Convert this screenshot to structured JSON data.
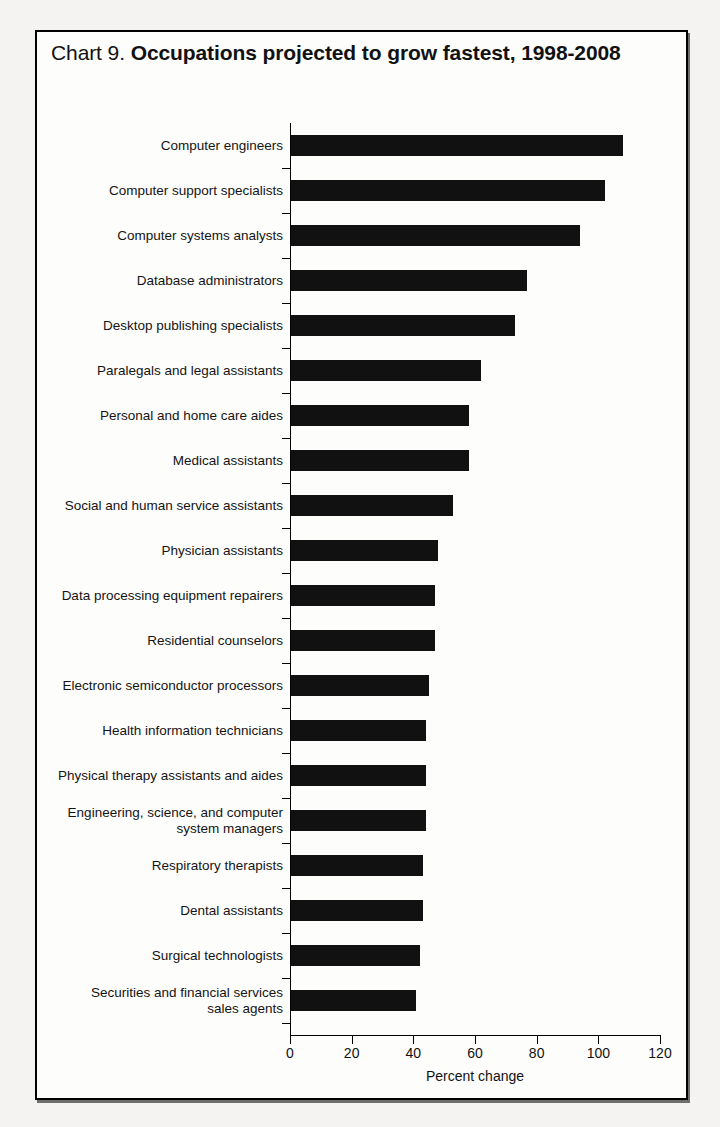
{
  "figure": {
    "title_prefix": "Chart 9.",
    "title_main": "Occupations projected to grow fastest, 1998-2008"
  },
  "chart_data": {
    "type": "bar",
    "orientation": "horizontal",
    "title": "Chart 9. Occupations projected to grow fastest, 1998-2008",
    "xlabel": "Percent change",
    "ylabel": "",
    "xlim": [
      0,
      120
    ],
    "xticks": [
      0,
      20,
      40,
      60,
      80,
      100,
      120
    ],
    "xtick_labels": [
      "0",
      "20",
      "40",
      "60",
      "80",
      "100",
      "120"
    ],
    "grid": false,
    "legend": null,
    "bar_color": "#111111",
    "categories": [
      "Computer engineers",
      "Computer support specialists",
      "Computer systems analysts",
      "Database administrators",
      "Desktop publishing specialists",
      "Paralegals and legal assistants",
      "Personal and home care aides",
      "Medical assistants",
      "Social and human service assistants",
      "Physician assistants",
      "Data processing equipment repairers",
      "Residential counselors",
      "Electronic semiconductor processors",
      "Health information technicians",
      "Physical therapy assistants and aides",
      "Engineering, science, and computer\nsystem managers",
      "Respiratory therapists",
      "Dental assistants",
      "Surgical technologists",
      "Securities and financial services\nsales agents"
    ],
    "values": [
      108,
      102,
      94,
      77,
      73,
      62,
      58,
      58,
      53,
      48,
      47,
      47,
      45,
      44,
      44,
      44,
      43,
      43,
      42,
      41
    ]
  }
}
